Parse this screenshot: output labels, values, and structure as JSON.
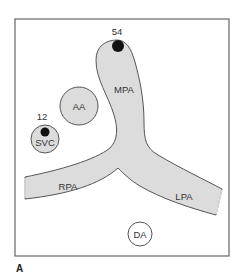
{
  "figure": {
    "panel_label": "A",
    "colors": {
      "vessel_fill": "#dcdcdc",
      "outline": "#555555",
      "frame": "#666666",
      "marker": "#111111",
      "background": "#ffffff"
    }
  },
  "structures": {
    "mpa": {
      "label": "MPA",
      "name": "Main pulmonary artery"
    },
    "rpa": {
      "label": "RPA",
      "name": "Right pulmonary artery"
    },
    "lpa": {
      "label": "LPA",
      "name": "Left pulmonary artery"
    },
    "aa": {
      "label": "AA",
      "name": "Ascending aorta"
    },
    "svc": {
      "label": "SVC",
      "name": "Superior vena cava"
    },
    "da": {
      "label": "DA",
      "name": "Descending aorta"
    }
  },
  "markers": {
    "mpa_value": "54",
    "svc_value": "12"
  }
}
